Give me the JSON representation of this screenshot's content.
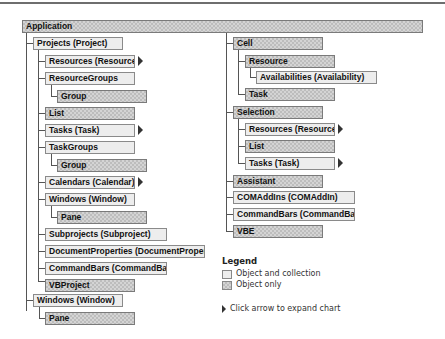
{
  "diagram": {
    "root": {
      "label": "Application",
      "type": "object_only"
    },
    "left_column": [
      {
        "label": "Projects (Project)",
        "type": "object_and_collection",
        "level": 1
      },
      {
        "label": "Resources (Resource)",
        "type": "object_and_collection",
        "level": 2,
        "expand_arrow": true
      },
      {
        "label": "ResourceGroups",
        "type": "object_and_collection",
        "level": 2
      },
      {
        "label": "Group",
        "type": "object_only",
        "level": 3
      },
      {
        "label": "List",
        "type": "object_only",
        "level": 2
      },
      {
        "label": "Tasks (Task)",
        "type": "object_and_collection",
        "level": 2,
        "expand_arrow": true
      },
      {
        "label": "TaskGroups",
        "type": "object_and_collection",
        "level": 2
      },
      {
        "label": "Group",
        "type": "object_only",
        "level": 3
      },
      {
        "label": "Calendars (Calendar)",
        "type": "object_and_collection",
        "level": 2,
        "expand_arrow": true
      },
      {
        "label": "Windows (Window)",
        "type": "object_and_collection",
        "level": 2
      },
      {
        "label": "Pane",
        "type": "object_only",
        "level": 3
      },
      {
        "label": "Subprojects (Subproject)",
        "type": "object_and_collection",
        "level": 2
      },
      {
        "label": "DocumentProperties (DocumentProperty)",
        "type": "object_and_collection",
        "level": 2
      },
      {
        "label": "CommandBars (CommandBar)",
        "type": "object_and_collection",
        "level": 2
      },
      {
        "label": "VBProject",
        "type": "object_only",
        "level": 2
      },
      {
        "label": "Windows (Window)",
        "type": "object_and_collection",
        "level": 1
      },
      {
        "label": "Pane",
        "type": "object_only",
        "level": 2
      }
    ],
    "right_column": [
      {
        "label": "Cell",
        "type": "object_only",
        "level": 1
      },
      {
        "label": "Resource",
        "type": "object_only",
        "level": 2
      },
      {
        "label": "Availabilities (Availability)",
        "type": "object_and_collection",
        "level": 3
      },
      {
        "label": "Task",
        "type": "object_only",
        "level": 2
      },
      {
        "label": "Selection",
        "type": "object_only",
        "level": 1
      },
      {
        "label": "Resources (Resource)",
        "type": "object_and_collection",
        "level": 2,
        "expand_arrow": true
      },
      {
        "label": "List",
        "type": "object_only",
        "level": 2
      },
      {
        "label": "Tasks (Task)",
        "type": "object_and_collection",
        "level": 2,
        "expand_arrow": true
      },
      {
        "label": "Assistant",
        "type": "object_only",
        "level": 1
      },
      {
        "label": "COMAddIns (COMAddIn)",
        "type": "object_and_collection",
        "level": 1
      },
      {
        "label": "CommandBars (CommandBar)",
        "type": "object_and_collection",
        "level": 1
      },
      {
        "label": "VBE",
        "type": "object_only",
        "level": 1
      }
    ]
  },
  "legend": {
    "title": "Legend",
    "items": [
      {
        "label": "Object and collection",
        "type": "object_and_collection"
      },
      {
        "label": "Object only",
        "type": "object_only"
      }
    ],
    "arrow_note": "Click arrow to expand chart"
  }
}
